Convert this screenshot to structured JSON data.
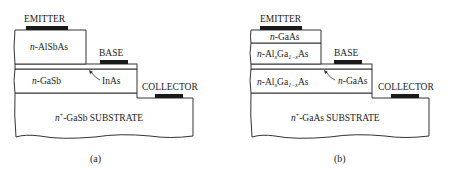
{
  "figure_a": {
    "caption": "(a)",
    "contacts": {
      "emitter": "EMITTER",
      "base": "BASE",
      "collector": "COLLECTOR"
    },
    "layers": {
      "emitter_layer": {
        "prefix": "n",
        "text": "-AlSbAs"
      },
      "base_layer": {
        "text": "InAs"
      },
      "collector_layer": {
        "prefix": "n",
        "text": "-GaSb"
      },
      "substrate": {
        "prefix": "n",
        "sup": "+",
        "text": "-GaSb SUBSTRATE"
      }
    }
  },
  "figure_b": {
    "caption": "(b)",
    "contacts": {
      "emitter": "EMITTER",
      "base": "BASE",
      "collector": "COLLECTOR"
    },
    "layers": {
      "cap_layer": {
        "prefix": "n",
        "text": "-GaAs"
      },
      "emitter_layer": {
        "prefix": "n",
        "text": "-Al",
        "sub1": "x",
        "mid": "Ga",
        "sub2": "1−x",
        "tail": "As"
      },
      "base_layer": {
        "prefix": "n",
        "text": "-GaAs"
      },
      "collector_layer": {
        "prefix": "n",
        "text": "-Al",
        "sub1": "x",
        "mid": "Ga",
        "sub2": "1−x",
        "tail": "As"
      },
      "substrate": {
        "prefix": "n",
        "sup": "+",
        "text": "-GaAs SUBSTRATE"
      }
    }
  }
}
